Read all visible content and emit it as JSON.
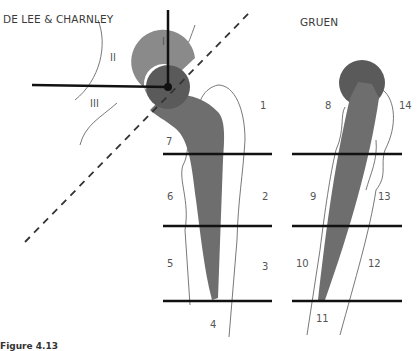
{
  "left_diagram": {
    "title": "DE LEE & CHARNLEY",
    "acetabular_zones": [
      "I",
      "II",
      "III"
    ],
    "femoral_zones": [
      "1",
      "2",
      "3",
      "4",
      "5",
      "6",
      "7"
    ]
  },
  "right_diagram": {
    "title": "GRUEN",
    "femoral_zones": [
      "8",
      "9",
      "10",
      "11",
      "12",
      "13",
      "14"
    ]
  },
  "colors": {
    "implant": "#6e6e6e",
    "cup": "#8a8a8a",
    "head": "#5a5a5a",
    "lines": "#111111",
    "bone_outline": "#555555"
  },
  "caption": "Figure 4.13"
}
